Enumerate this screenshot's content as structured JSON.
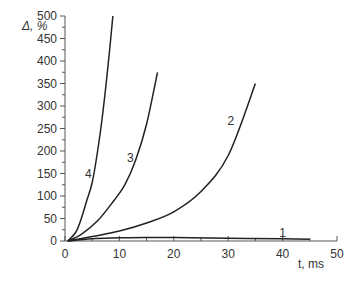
{
  "chart_data": {
    "type": "line",
    "title": "",
    "xlabel": "t, ms",
    "ylabel": "Δ, %",
    "xlim": [
      0,
      50
    ],
    "ylim": [
      0,
      500
    ],
    "x_ticks": [
      0,
      10,
      20,
      30,
      40,
      50
    ],
    "y_ticks": [
      0,
      50,
      100,
      150,
      200,
      250,
      300,
      350,
      400,
      450,
      500
    ],
    "grid": false,
    "legend": "inline curve labels",
    "series": [
      {
        "name": "1",
        "x": [
          0.5,
          5,
          10,
          15,
          20,
          30,
          40,
          45
        ],
        "y": [
          0,
          5,
          7,
          8,
          7.5,
          6,
          5,
          4
        ]
      },
      {
        "name": "2",
        "x": [
          0.5,
          5,
          10,
          15,
          20,
          25,
          30,
          35
        ],
        "y": [
          0,
          10,
          22,
          40,
          65,
          110,
          190,
          350
        ]
      },
      {
        "name": "3",
        "x": [
          0.5,
          3,
          6,
          9,
          11,
          13,
          15,
          17
        ],
        "y": [
          0,
          15,
          45,
          90,
          125,
          180,
          260,
          375
        ]
      },
      {
        "name": "4",
        "x": [
          0.5,
          2,
          3,
          4,
          5,
          6,
          7,
          8,
          8.8
        ],
        "y": [
          0,
          20,
          50,
          90,
          130,
          200,
          290,
          400,
          500
        ]
      }
    ],
    "annotations": [
      {
        "text": "1",
        "x": 40,
        "y": 8
      },
      {
        "text": "2",
        "x": 30.5,
        "y": 258
      },
      {
        "text": "3",
        "x": 12,
        "y": 175
      },
      {
        "text": "4",
        "x": 4.3,
        "y": 140
      }
    ]
  },
  "labels": {
    "y_axis": "Δ, %",
    "x_axis": "t, ms"
  }
}
